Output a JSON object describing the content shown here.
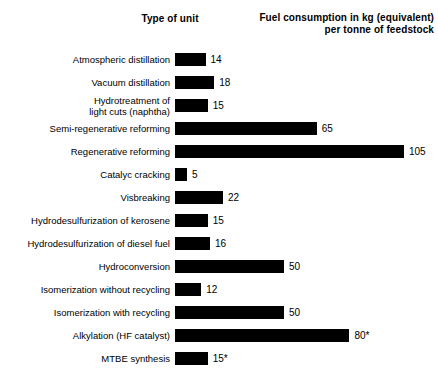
{
  "headers": {
    "left": "Type of unit",
    "right_line1": "Fuel consumption in kg (equivalent)",
    "right_line2": "per tonne of feedstock"
  },
  "chart_data": {
    "type": "bar",
    "orientation": "horizontal",
    "title": "",
    "xlabel": "Fuel consumption in kg (equivalent) per tonne of feedstock",
    "ylabel": "Type of unit",
    "xlim": [
      0,
      105
    ],
    "grid": false,
    "legend": "none",
    "note": "Values marked with * are approximate/footnoted in the source.",
    "categories": [
      "Atmospheric distillation",
      "Vacuum distillation",
      "Hydrotreatment of light cuts (naphtha)",
      "Semi-regenerative reforming",
      "Regenerative reforming",
      "Catalyc cracking",
      "Visbreaking",
      "Hydrodesulfurization of kerosene",
      "Hydrodesulfurization of diesel fuel",
      "Hydroconversion",
      "Isomerization without recycling",
      "Isomerization with recycling",
      "Alkylation (HF catalyst)",
      "MTBE synthesis"
    ],
    "values": [
      14,
      18,
      15,
      65,
      105,
      5,
      22,
      15,
      16,
      50,
      12,
      50,
      80,
      15
    ],
    "value_labels": [
      "14",
      "18",
      "15",
      "65",
      "105",
      "5",
      "22",
      "15",
      "16",
      "50",
      "12",
      "50",
      "80*",
      "15*"
    ],
    "bar_color": "#000000"
  },
  "rows": [
    {
      "label_lines": [
        "Atmospheric distillation"
      ],
      "value": 14,
      "value_label": "14"
    },
    {
      "label_lines": [
        "Vacuum distillation"
      ],
      "value": 18,
      "value_label": "18"
    },
    {
      "label_lines": [
        "Hydrotreatment of",
        "light cuts (naphtha)"
      ],
      "value": 15,
      "value_label": "15"
    },
    {
      "label_lines": [
        "Semi-regenerative reforming"
      ],
      "value": 65,
      "value_label": "65"
    },
    {
      "label_lines": [
        "Regenerative reforming"
      ],
      "value": 105,
      "value_label": "105"
    },
    {
      "label_lines": [
        "Catalyc cracking"
      ],
      "value": 5,
      "value_label": "5"
    },
    {
      "label_lines": [
        "Visbreaking"
      ],
      "value": 22,
      "value_label": "22"
    },
    {
      "label_lines": [
        "Hydrodesulfurization of kerosene"
      ],
      "value": 15,
      "value_label": "15"
    },
    {
      "label_lines": [
        "Hydrodesulfurization of diesel fuel"
      ],
      "value": 16,
      "value_label": "16"
    },
    {
      "label_lines": [
        "Hydroconversion"
      ],
      "value": 50,
      "value_label": "50"
    },
    {
      "label_lines": [
        "Isomerization without recycling"
      ],
      "value": 12,
      "value_label": "12"
    },
    {
      "label_lines": [
        "Isomerization with recycling"
      ],
      "value": 50,
      "value_label": "50"
    },
    {
      "label_lines": [
        "Alkylation (HF catalyst)"
      ],
      "value": 80,
      "value_label": "80*"
    },
    {
      "label_lines": [
        "MTBE synthesis"
      ],
      "value": 15,
      "value_label": "15*"
    }
  ],
  "scale": {
    "px_per_unit": 2.18,
    "min_bar_px": 12
  }
}
